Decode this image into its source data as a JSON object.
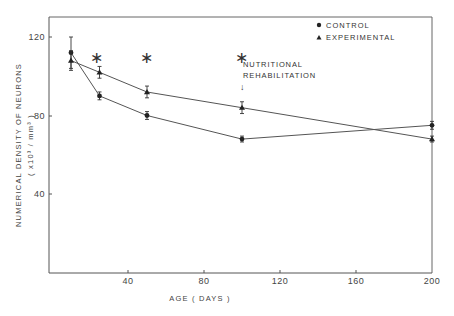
{
  "chart_data": {
    "type": "line",
    "title": "",
    "xlabel": "AGE  ( DAYS )",
    "ylabel": "NUMERICAL DENSITY OF NEURONS",
    "ylabel_units": "( x10³ / mm³ )",
    "xlim": [
      0,
      200
    ],
    "ylim": [
      0,
      130
    ],
    "x_ticks": [
      40,
      80,
      120,
      160,
      200
    ],
    "y_ticks": [
      40,
      80,
      120
    ],
    "grid": false,
    "legend_position": "top-right",
    "series": [
      {
        "name": "CONTROL",
        "marker": "circle",
        "x": [
          10,
          25,
          50,
          100,
          200
        ],
        "values": [
          112,
          90,
          80,
          68,
          75
        ],
        "error": [
          8,
          2,
          2,
          1.5,
          2
        ]
      },
      {
        "name": "EXPERIMENTAL",
        "marker": "triangle",
        "x": [
          10,
          25,
          50,
          100,
          200
        ],
        "values": [
          108,
          102,
          92,
          84,
          68
        ],
        "error": [
          5,
          3,
          3,
          3,
          1.5
        ]
      }
    ],
    "annotations": [
      {
        "text": "*",
        "x": 25,
        "y": 110,
        "meaning": "significant difference"
      },
      {
        "text": "*",
        "x": 50,
        "y": 110,
        "meaning": "significant difference"
      },
      {
        "text": "*",
        "x": 100,
        "y": 110,
        "meaning": "significant difference"
      },
      {
        "text": "NUTRITIONAL REHABILITATION",
        "x": 100,
        "y": 104,
        "arrow": "down"
      }
    ]
  },
  "legend": {
    "control": "CONTROL",
    "experimental": "EXPERIMENTAL"
  },
  "annotation": {
    "line1": "NUTRITIONAL",
    "line2": "REHABILITATION",
    "arrow": "↓",
    "asterisk": "∗"
  },
  "axes": {
    "x_label": "AGE  ( DAYS )",
    "y_label": "NUMERICAL DENSITY OF NEURONS",
    "y_units": "( x10³ / mm³ )",
    "x_ticks": [
      "40",
      "80",
      "120",
      "160",
      "200"
    ],
    "y_ticks": [
      "120",
      "80",
      "40"
    ]
  },
  "colors": {
    "ink": "#2a2a2a",
    "line": "#555555",
    "frame": "#666666"
  }
}
